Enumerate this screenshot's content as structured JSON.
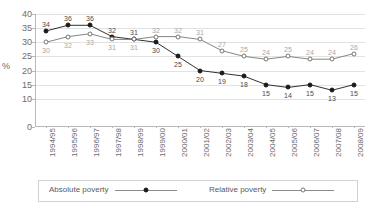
{
  "chart_data": {
    "type": "line",
    "title": "",
    "xlabel": "",
    "ylabel": "%",
    "ylim": [
      0,
      40
    ],
    "ytick_step": 5,
    "yticks": [
      "40",
      "35",
      "30",
      "25",
      "20",
      "15",
      "10",
      "0"
    ],
    "ytick_values": [
      40,
      35,
      30,
      25,
      20,
      15,
      10,
      0
    ],
    "grid": true,
    "legend_position": "bottom",
    "categories": [
      "1994/95",
      "1995/96",
      "1996/97",
      "1997/98",
      "1998/99",
      "1999/00",
      "2000/01",
      "2001/02",
      "2002/03",
      "2003/04",
      "2004/05",
      "2005/06",
      "2006/07",
      "2007/08",
      "2008/09"
    ],
    "series": [
      {
        "name": "Absolute poverty",
        "marker": "filled-circle",
        "color": "#1a1a1a",
        "values": [
          34,
          36,
          36,
          32,
          31,
          30,
          25,
          20,
          19,
          18,
          15,
          14,
          15,
          13,
          15
        ]
      },
      {
        "name": "Relative poverty",
        "marker": "open-circle",
        "color": "#777777",
        "values": [
          30,
          32,
          33,
          31,
          31,
          32,
          32,
          31,
          27,
          25,
          24,
          25,
          24,
          24,
          26
        ]
      }
    ]
  },
  "legend": {
    "entries": [
      {
        "label": "Absolute poverty",
        "marker": "filled-circle"
      },
      {
        "label": "Relative poverty",
        "marker": "open-circle"
      }
    ]
  }
}
